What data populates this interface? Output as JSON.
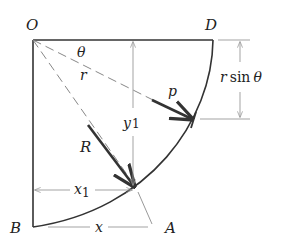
{
  "diagram": {
    "points": {
      "O": "O",
      "D": "D",
      "B": "B",
      "A": "A"
    },
    "labels": {
      "theta": "θ",
      "r": "r",
      "p": "p",
      "R": "R",
      "y1_main": "y",
      "y1_sub": "1",
      "x1_main": "x",
      "x1_sub": "1",
      "x": "x",
      "rsin_r": "r",
      "rsin_sin": "sin",
      "rsin_theta": "θ"
    },
    "colors": {
      "outline": "#333333",
      "arrow": "#333333",
      "dimension": "#9a9a9a",
      "dashed": "#8a8a8a"
    }
  }
}
